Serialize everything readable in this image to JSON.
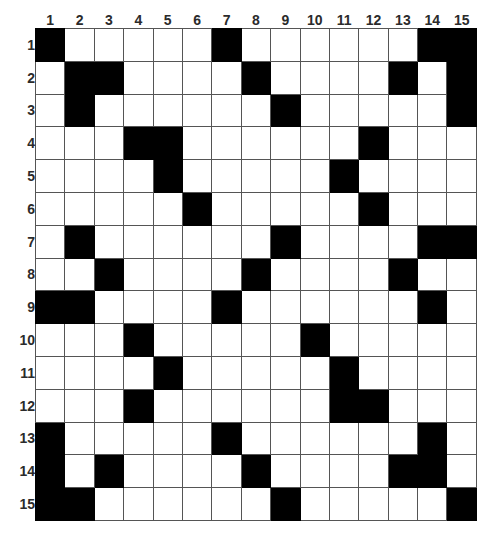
{
  "widget": {
    "name": "nonogram-solution-grid",
    "rows": 15,
    "cols": 15,
    "fill_color": "#000000",
    "empty_color": "#ffffff",
    "grid_line_color": "#555555",
    "label_color": "#2b2b2b"
  },
  "column_headers": [
    "1",
    "2",
    "3",
    "4",
    "5",
    "6",
    "7",
    "8",
    "9",
    "10",
    "11",
    "12",
    "13",
    "14",
    "15"
  ],
  "row_headers": [
    "1",
    "2",
    "3",
    "4",
    "5",
    "6",
    "7",
    "8",
    "9",
    "10",
    "11",
    "12",
    "13",
    "14",
    "15"
  ],
  "chart_data": {
    "type": "heatmap",
    "title": "",
    "xlabel": "",
    "ylabel": "",
    "categories": [
      "1",
      "2",
      "3",
      "4",
      "5",
      "6",
      "7",
      "8",
      "9",
      "10",
      "11",
      "12",
      "13",
      "14",
      "15"
    ],
    "rows": [
      "1",
      "2",
      "3",
      "4",
      "5",
      "6",
      "7",
      "8",
      "9",
      "10",
      "11",
      "12",
      "13",
      "14",
      "15"
    ],
    "legend": [],
    "grid": true,
    "value_map": {
      "0": "empty-white",
      "1": "filled-black"
    },
    "values": [
      [
        1,
        0,
        0,
        0,
        0,
        0,
        1,
        0,
        0,
        0,
        0,
        0,
        0,
        1,
        1
      ],
      [
        0,
        1,
        1,
        0,
        0,
        0,
        0,
        1,
        0,
        0,
        0,
        0,
        1,
        0,
        1
      ],
      [
        0,
        1,
        0,
        0,
        0,
        0,
        0,
        0,
        1,
        0,
        0,
        0,
        0,
        0,
        1
      ],
      [
        0,
        0,
        0,
        1,
        1,
        0,
        0,
        0,
        0,
        0,
        0,
        1,
        0,
        0,
        0
      ],
      [
        0,
        0,
        0,
        0,
        1,
        0,
        0,
        0,
        0,
        0,
        1,
        0,
        0,
        0,
        0
      ],
      [
        0,
        0,
        0,
        0,
        0,
        1,
        0,
        0,
        0,
        0,
        0,
        1,
        0,
        0,
        0
      ],
      [
        0,
        1,
        0,
        0,
        0,
        0,
        0,
        0,
        1,
        0,
        0,
        0,
        0,
        1,
        1
      ],
      [
        0,
        0,
        1,
        0,
        0,
        0,
        0,
        1,
        0,
        0,
        0,
        0,
        1,
        0,
        0
      ],
      [
        1,
        1,
        0,
        0,
        0,
        0,
        1,
        0,
        0,
        0,
        0,
        0,
        0,
        1,
        0
      ],
      [
        0,
        0,
        0,
        1,
        0,
        0,
        0,
        0,
        0,
        1,
        0,
        0,
        0,
        0,
        0
      ],
      [
        0,
        0,
        0,
        0,
        1,
        0,
        0,
        0,
        0,
        0,
        1,
        0,
        0,
        0,
        0
      ],
      [
        0,
        0,
        0,
        1,
        0,
        0,
        0,
        0,
        0,
        0,
        1,
        1,
        0,
        0,
        0
      ],
      [
        1,
        0,
        0,
        0,
        0,
        0,
        1,
        0,
        0,
        0,
        0,
        0,
        0,
        1,
        0
      ],
      [
        1,
        0,
        1,
        0,
        0,
        0,
        0,
        1,
        0,
        0,
        0,
        0,
        1,
        1,
        0
      ],
      [
        1,
        1,
        0,
        0,
        0,
        0,
        0,
        0,
        1,
        0,
        0,
        0,
        0,
        0,
        1
      ]
    ],
    "filled_cells_per_row": [
      [
        1,
        7,
        14,
        15
      ],
      [
        2,
        3,
        8,
        13,
        15
      ],
      [
        2,
        9,
        15
      ],
      [
        4,
        5,
        12
      ],
      [
        5,
        11
      ],
      [
        6,
        12
      ],
      [
        2,
        9,
        14,
        15
      ],
      [
        3,
        8,
        13
      ],
      [
        1,
        2,
        7,
        14
      ],
      [
        4,
        10
      ],
      [
        5,
        11
      ],
      [
        4,
        11,
        12
      ],
      [
        1,
        7,
        14
      ],
      [
        1,
        3,
        8,
        13,
        14
      ],
      [
        1,
        2,
        9,
        15
      ]
    ]
  }
}
